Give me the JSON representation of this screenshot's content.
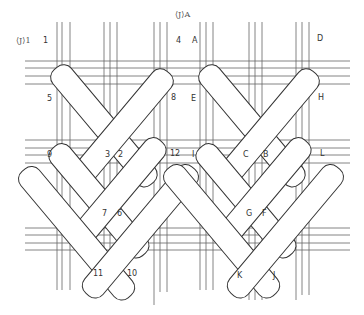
{
  "figure": {
    "type": "weaving-diagram",
    "line_color": "#555555",
    "strip_fill": "#ffffff"
  },
  "titles": {
    "left": "⟨J⟩1",
    "right": "⟨J⟩A"
  },
  "left_group_labels": {
    "p1": "1",
    "p2": "2",
    "p3": "3",
    "p4": "4",
    "p5": "5",
    "p6": "6",
    "p7": "7",
    "p8": "8",
    "p9": "9",
    "p10": "10",
    "p11": "11",
    "p12": "12"
  },
  "right_group_labels": {
    "pA": "A",
    "pB": "B",
    "pC": "C",
    "pD": "D",
    "pE": "E",
    "pF": "F",
    "pG": "G",
    "pH": "H",
    "pI": "I",
    "pJ": "J",
    "pK": "K",
    "pL": "L"
  }
}
